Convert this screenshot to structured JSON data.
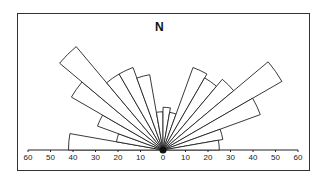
{
  "chart_data": {
    "type": "rose",
    "title": "N",
    "subtitle": "",
    "xlabel": "",
    "ylabel": "",
    "orientation": "semicircle, W (270°) through N (0°) to E (90°)",
    "bin_width_deg": 10,
    "categories": [
      "270-280",
      "280-290",
      "290-300",
      "300-310",
      "310-320",
      "320-330",
      "330-340",
      "340-350",
      "350-360",
      "0-10",
      "10-20",
      "20-30",
      "30-40",
      "40-50",
      "50-60",
      "60-70",
      "70-80",
      "80-90"
    ],
    "values": [
      42,
      21,
      31,
      47,
      60,
      39,
      39,
      34,
      17,
      19,
      17,
      39,
      37,
      41,
      61,
      46,
      27,
      25
    ],
    "axis_ticks": [
      "60",
      "50",
      "40",
      "30",
      "20",
      "10",
      "0",
      "10",
      "20",
      "30",
      "40",
      "50",
      "60"
    ],
    "axis_range": [
      0,
      60
    ],
    "grid": false,
    "legend": null
  },
  "labels": {
    "north": "N"
  }
}
